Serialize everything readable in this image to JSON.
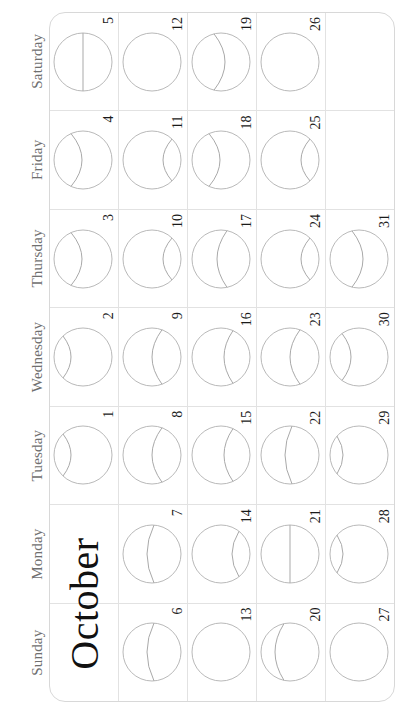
{
  "document": {
    "type": "moon-phase-calendar",
    "month_title": "October",
    "orientation_note": "landscape sheet displayed rotated 90 degrees counter-clockwise"
  },
  "colors": {
    "page_background": "#ffffff",
    "grid_line": "#e2e2e2",
    "card_border": "#d8d8d8",
    "moon_outline": "#b9b9b9",
    "moon_terminator": "#a9a9a9",
    "day_name_text": "#6f6f6f",
    "day_number_text": "#1a1a1a",
    "month_title_text": "#111111"
  },
  "day_names": [
    "Sunday",
    "Monday",
    "Tuesday",
    "Wednesday",
    "Thursday",
    "Friday",
    "Saturday"
  ],
  "weeks": [
    {
      "index": 1,
      "days": [
        {
          "number": "",
          "moon": "none",
          "is_month_title": true
        },
        {
          "number": "",
          "moon": "none",
          "is_month_title": true
        },
        {
          "number": "1",
          "moon": "gibbous-top-shallow"
        },
        {
          "number": "2",
          "moon": "gibbous-top-shallow"
        },
        {
          "number": "3",
          "moon": "gibbous-top-mid"
        },
        {
          "number": "4",
          "moon": "gibbous-top-mid"
        },
        {
          "number": "5",
          "moon": "half-straight"
        }
      ]
    },
    {
      "index": 2,
      "days": [
        {
          "number": "6",
          "moon": "crescent-center"
        },
        {
          "number": "7",
          "moon": "crescent-center"
        },
        {
          "number": "8",
          "moon": "crescent-low"
        },
        {
          "number": "9",
          "moon": "crescent-low"
        },
        {
          "number": "10",
          "moon": "crescent-verylow"
        },
        {
          "number": "11",
          "moon": "crescent-verylow"
        },
        {
          "number": "12",
          "moon": "full"
        }
      ]
    },
    {
      "index": 3,
      "days": [
        {
          "number": "13",
          "moon": "full"
        },
        {
          "number": "14",
          "moon": "gibbous-bottom-verylow"
        },
        {
          "number": "15",
          "moon": "gibbous-bottom-low"
        },
        {
          "number": "16",
          "moon": "gibbous-bottom-low"
        },
        {
          "number": "17",
          "moon": "gibbous-bottom-mid"
        },
        {
          "number": "18",
          "moon": "gibbous-top-mid"
        },
        {
          "number": "19",
          "moon": "gibbous-top-high"
        }
      ]
    },
    {
      "index": 4,
      "days": [
        {
          "number": "20",
          "moon": "crescent-high"
        },
        {
          "number": "21",
          "moon": "half-straight"
        },
        {
          "number": "22",
          "moon": "crescent-center"
        },
        {
          "number": "23",
          "moon": "crescent-low"
        },
        {
          "number": "24",
          "moon": "crescent-verylow"
        },
        {
          "number": "25",
          "moon": "crescent-verylow"
        },
        {
          "number": "26",
          "moon": "full"
        }
      ]
    },
    {
      "index": 5,
      "days": [
        {
          "number": "27",
          "moon": "full"
        },
        {
          "number": "28",
          "moon": "gibbous-top-verylow"
        },
        {
          "number": "29",
          "moon": "gibbous-top-verylow"
        },
        {
          "number": "30",
          "moon": "gibbous-top-low"
        },
        {
          "number": "31",
          "moon": "gibbous-top-high"
        },
        {
          "number": "",
          "moon": "none"
        },
        {
          "number": "",
          "moon": "none"
        }
      ]
    }
  ]
}
